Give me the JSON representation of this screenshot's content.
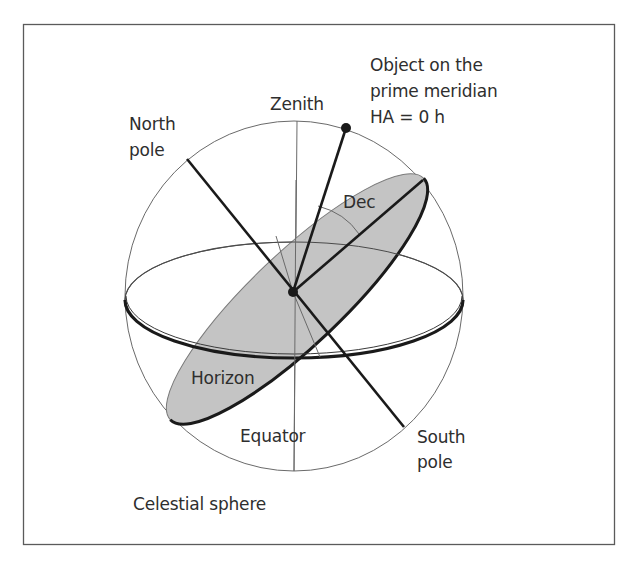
{
  "figure": {
    "title": "Celestial sphere",
    "colors": {
      "frame": "#5a5a5a",
      "sphere_outline": "#6a6a6a",
      "thin_line": "#6a6a6a",
      "heavy_line": "#1a1a1a",
      "plane_fill": "#c4c4c4",
      "text": "#2e2e2e",
      "background": "#ffffff"
    }
  },
  "labels": {
    "zenith": "Zenith",
    "north_pole_line1": "North",
    "north_pole_line2": "pole",
    "south_pole_line1": "South",
    "south_pole_line2": "pole",
    "object_line1": "Object on the",
    "object_line2": "prime meridian",
    "object_line3": "HA = 0 h",
    "dec": "Dec",
    "horizon": "Horizon",
    "equator": "Equator",
    "caption": "Celestial sphere"
  },
  "geometry": {
    "sphere": {
      "cx": 294,
      "cy": 296,
      "rx": 169,
      "ry": 175
    },
    "observer_center": {
      "x": 293,
      "y": 292
    },
    "object_point": {
      "x": 346,
      "y": 128
    },
    "north_pole_end": {
      "x": 187,
      "y": 159
    },
    "south_pole_end": {
      "x": 404,
      "y": 427
    }
  }
}
